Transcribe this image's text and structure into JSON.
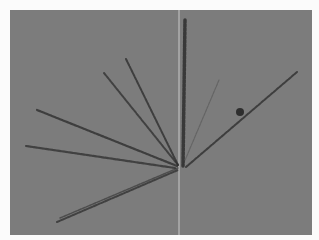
{
  "image": {
    "description": "Micrograph of radiating needle-shaped crystals on a gray background",
    "background_color": "#7c7c7c",
    "margin_color": "#fbfbfb",
    "needle_color": "#2e2e2e",
    "center": [
      180,
      167
    ],
    "needles": [
      {
        "x1": 185,
        "y1": 20,
        "x2": 183,
        "y2": 166,
        "width": 3.5,
        "opacity": 0.85
      },
      {
        "x1": 126,
        "y1": 59,
        "x2": 178,
        "y2": 165,
        "width": 2,
        "opacity": 0.8
      },
      {
        "x1": 104,
        "y1": 73,
        "x2": 178,
        "y2": 165,
        "width": 2,
        "opacity": 0.75
      },
      {
        "x1": 37,
        "y1": 110,
        "x2": 177,
        "y2": 166,
        "width": 2.2,
        "opacity": 0.8
      },
      {
        "x1": 26,
        "y1": 146,
        "x2": 175,
        "y2": 168,
        "width": 2.2,
        "opacity": 0.75
      },
      {
        "x1": 57,
        "y1": 222,
        "x2": 178,
        "y2": 170,
        "width": 2,
        "opacity": 0.75
      },
      {
        "x1": 60,
        "y1": 218,
        "x2": 178,
        "y2": 168,
        "width": 1.5,
        "opacity": 0.6
      },
      {
        "x1": 219,
        "y1": 80,
        "x2": 183,
        "y2": 165,
        "width": 1.2,
        "opacity": 0.3
      },
      {
        "x1": 297,
        "y1": 72,
        "x2": 186,
        "y2": 167,
        "width": 2,
        "opacity": 0.8
      }
    ],
    "blobs": [
      {
        "cx": 240,
        "cy": 112,
        "r": 4
      }
    ],
    "vertical_line": {
      "x": 179,
      "color": "#c9c9c9"
    }
  }
}
